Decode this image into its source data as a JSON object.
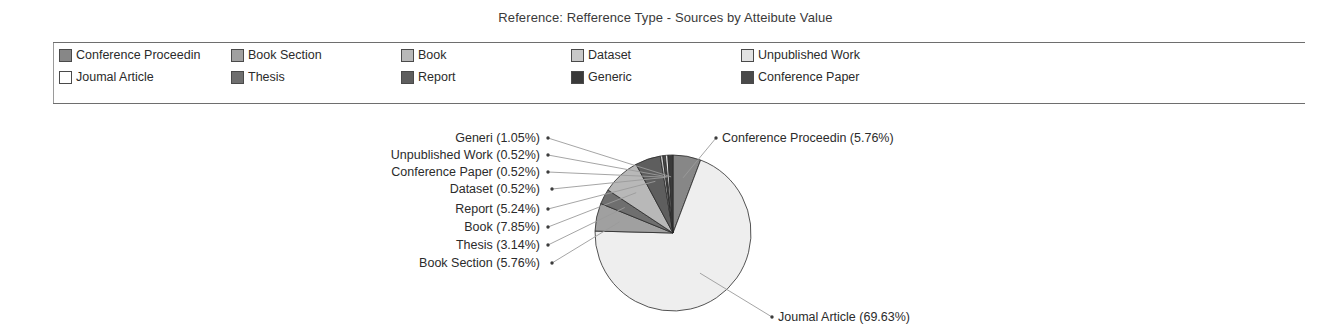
{
  "title": "Reference: Refference Type - Sources by Atteibute Value",
  "legend": {
    "items": [
      {
        "label": "Conference Proceedin",
        "color": "#878787",
        "col": 0,
        "row": 0
      },
      {
        "label": "Joumal Article",
        "color": "#ffffff",
        "col": 0,
        "row": 1
      },
      {
        "label": "Book Section",
        "color": "#a0a0a0",
        "col": 1,
        "row": 0
      },
      {
        "label": "Thesis",
        "color": "#6f6f6f",
        "col": 1,
        "row": 1
      },
      {
        "label": "Book",
        "color": "#b8b8b8",
        "col": 2,
        "row": 0
      },
      {
        "label": "Report",
        "color": "#5e5e5e",
        "col": 2,
        "row": 1
      },
      {
        "label": "Dataset",
        "color": "#c8c8c8",
        "col": 3,
        "row": 0
      },
      {
        "label": "Generic",
        "color": "#3a3a3a",
        "col": 3,
        "row": 1
      },
      {
        "label": "Unpublished Work",
        "color": "#e2e2e2",
        "col": 4,
        "row": 0
      },
      {
        "label": "Conference Paper",
        "color": "#4a4a4a",
        "col": 4,
        "row": 1
      }
    ]
  },
  "chart_data": {
    "type": "pie",
    "title": "Reference: Refference Type - Sources by Atteibute Value",
    "legend_position": "top",
    "start_angle_deg": 0,
    "direction": "clockwise",
    "categories": [
      "Conference Proceedin",
      "Joumal Article",
      "Book Section",
      "Thesis",
      "Book",
      "Report",
      "Dataset",
      "Conference Paper",
      "Unpublished Work",
      "Generi"
    ],
    "values": [
      5.76,
      69.63,
      5.76,
      3.14,
      7.85,
      5.24,
      0.52,
      0.52,
      0.52,
      1.05
    ],
    "unit": "%",
    "slices": [
      {
        "label": "Conference Proceedin",
        "value": 5.76,
        "text": "Conference Proceedin (5.76%)",
        "color": "#878787"
      },
      {
        "label": "Joumal Article",
        "value": 69.63,
        "text": "Joumal Article (69.63%)",
        "color": "#eeeeee"
      },
      {
        "label": "Book Section",
        "value": 5.76,
        "text": "Book Section (5.76%)",
        "color": "#a0a0a0"
      },
      {
        "label": "Thesis",
        "value": 3.14,
        "text": "Thesis (3.14%)",
        "color": "#6f6f6f"
      },
      {
        "label": "Book",
        "value": 7.85,
        "text": "Book (7.85%)",
        "color": "#b8b8b8"
      },
      {
        "label": "Report",
        "value": 5.24,
        "text": "Report (5.24%)",
        "color": "#5e5e5e"
      },
      {
        "label": "Dataset",
        "value": 0.52,
        "text": "Dataset (0.52%)",
        "color": "#c8c8c8"
      },
      {
        "label": "Conference Paper",
        "value": 0.52,
        "text": "Conference Paper (0.52%)",
        "color": "#4a4a4a"
      },
      {
        "label": "Unpublished Work",
        "value": 0.52,
        "text": "Unpublished Work (0.52%)",
        "color": "#e2e2e2"
      },
      {
        "label": "Generi",
        "value": 1.05,
        "text": "Generi (1.05%)",
        "color": "#3a3a3a"
      }
    ],
    "labels": {
      "generi": "Generi (1.05%)",
      "unpublished_work": "Unpublished Work (0.52%)",
      "conference_paper": "Conference Paper (0.52%)",
      "dataset": "Dataset (0.52%)",
      "report": "Report (5.24%)",
      "book": "Book (7.85%)",
      "thesis": "Thesis (3.14%)",
      "book_section": "Book Section (5.76%)",
      "conference_proceedin": "Conference Proceedin (5.76%)",
      "joumal_article": "Joumal Article (69.63%)"
    }
  }
}
